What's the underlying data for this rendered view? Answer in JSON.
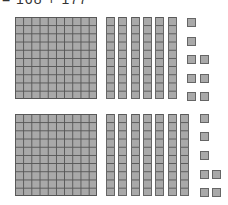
{
  "equation": "= 168 + 177",
  "colors": {
    "block_fill": "#a9a9a9",
    "block_line": "#555555"
  },
  "rows": [
    {
      "value": 168,
      "hundreds": 1,
      "tens": 6,
      "ones": 8,
      "origin_y": 17,
      "hundred_x": 15,
      "tens_x": 106,
      "units": [
        [
          187,
          18
        ],
        [
          187,
          37
        ],
        [
          187,
          55
        ],
        [
          200,
          55
        ],
        [
          187,
          74
        ],
        [
          200,
          74
        ],
        [
          187,
          92
        ],
        [
          200,
          92
        ]
      ]
    },
    {
      "value": 177,
      "hundreds": 1,
      "tens": 7,
      "ones": 7,
      "origin_y": 114,
      "hundred_x": 15,
      "tens_x": 106,
      "units": [
        [
          200,
          114
        ],
        [
          200,
          132
        ],
        [
          200,
          151
        ],
        [
          200,
          170
        ],
        [
          212,
          170
        ],
        [
          200,
          188
        ],
        [
          212,
          188
        ]
      ]
    }
  ]
}
